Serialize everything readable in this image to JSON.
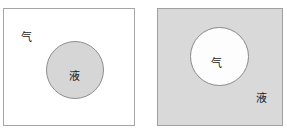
{
  "figure": {
    "width": 287,
    "height": 132,
    "background_color": "#ffffff"
  },
  "colors": {
    "white_fill": "#ffffff",
    "gray_fill": "#d9d9d9",
    "circle_gray_fill": "#d6d6d6",
    "circle_white_fill": "#fdfdfd",
    "stroke": "#8e8e8e",
    "frame_stroke": "#a0a0a0",
    "text": "#1a1a1a"
  },
  "panels": [
    {
      "id": "left",
      "name": "liquid-droplet-in-gas",
      "frame_fill": "#ffffff",
      "circle_fill": "#d6d6d6",
      "outside_label": "气",
      "inside_label": "液"
    },
    {
      "id": "right",
      "name": "gas-bubble-in-liquid",
      "frame_fill": "#d9d9d9",
      "circle_fill": "#fdfdfd",
      "outside_label": "液",
      "inside_label": "气"
    }
  ],
  "labels": {
    "left_gas": "气",
    "left_liquid": "液",
    "right_gas": "气",
    "right_liquid": "液"
  }
}
